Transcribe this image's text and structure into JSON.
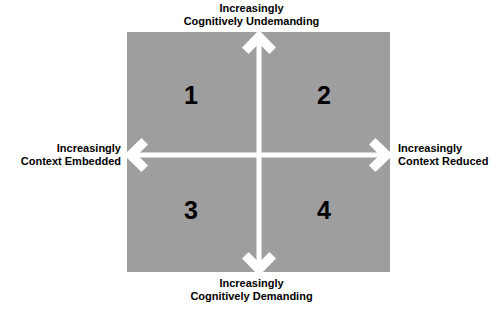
{
  "diagram": {
    "type": "2x2-quadrant-matrix",
    "box_color": "#9e9e9e",
    "arrow_color": "#ffffff",
    "text_color": "#000000",
    "background_color": "#ffffff"
  },
  "axes": {
    "vertical": {
      "top_label": "Increasingly\nCognitively Undemanding",
      "bottom_label": "Increasingly\nCognitively Demanding",
      "top_label_line1": "Increasingly",
      "top_label_line2": "Cognitively Undemanding",
      "bottom_label_line1": "Increasingly",
      "bottom_label_line2": "Cognitively Demanding",
      "arrow_style": "double-ended-vertical"
    },
    "horizontal": {
      "left_label": "Increasingly\nContext Embedded",
      "right_label": "Increasingly\nContext Reduced",
      "left_label_line1": "Increasingly",
      "left_label_line2": "Context Embedded",
      "right_label_line1": "Increasingly",
      "right_label_line2": "Context Reduced",
      "arrow_style": "double-ended-horizontal"
    }
  },
  "quadrants": [
    {
      "number": "1",
      "position": "top-left",
      "description": "Cognitively Undemanding / Context Embedded"
    },
    {
      "number": "2",
      "position": "top-right",
      "description": "Cognitively Undemanding / Context Reduced"
    },
    {
      "number": "3",
      "position": "bottom-left",
      "description": "Cognitively Demanding / Context Embedded"
    },
    {
      "number": "4",
      "position": "bottom-right",
      "description": "Cognitively Demanding / Context Reduced"
    }
  ]
}
